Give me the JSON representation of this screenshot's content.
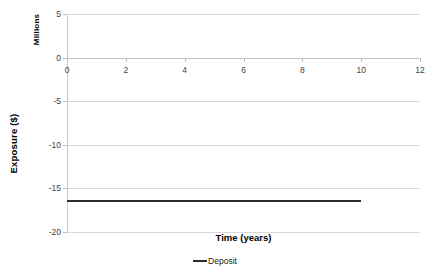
{
  "chart_data": {
    "type": "line",
    "title": "",
    "xlabel": "Time (years)",
    "ylabel": "Exposure ($)",
    "y_unit_label": "Millions",
    "xlim": [
      0,
      12
    ],
    "ylim": [
      -20,
      5
    ],
    "x_ticks": [
      "0",
      "2",
      "4",
      "6",
      "8",
      "10",
      "12"
    ],
    "x_tick_values": [
      0,
      2,
      4,
      6,
      8,
      10,
      12
    ],
    "y_ticks": [
      "5",
      "0",
      "-5",
      "-10",
      "-15",
      "-20"
    ],
    "y_tick_values": [
      5,
      0,
      -5,
      -10,
      -15,
      -20
    ],
    "grid": "horizontal",
    "legend_position": "bottom",
    "series": [
      {
        "name": "Deposit",
        "color": "#2b2b2b",
        "x": [
          0,
          10
        ],
        "values": [
          -16.5,
          -16.5
        ]
      }
    ]
  },
  "legend": {
    "items": [
      {
        "label": "Deposit"
      }
    ]
  },
  "colors": {
    "series_deposit": "#2b2b2b",
    "gridline": "#d9d9d9",
    "axis": "#bfbfbf",
    "tick_text": "#3f3f3f"
  }
}
